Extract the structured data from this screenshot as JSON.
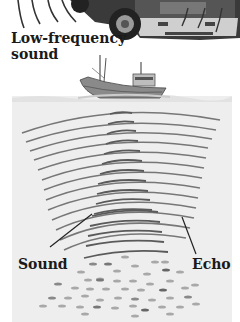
{
  "diagram": {
    "labels": {
      "low_frequency_line1": "Low-frequency",
      "low_frequency_line2": "sound",
      "sound": "Sound",
      "echo": "Echo"
    },
    "elements": {
      "truck": "truck-illustration",
      "ship": "fishing-boat-illustration",
      "water": "sea-cross-section",
      "sound_waves": "sonar-sound-waves",
      "echo_waves": "echo-waves",
      "fish": "fish-school"
    },
    "colors": {
      "background": "#ffffff",
      "water": "#eeeeee",
      "wave": "#6f6f6f",
      "text": "#1a1a1a",
      "fish": "#a8a8a8"
    }
  }
}
